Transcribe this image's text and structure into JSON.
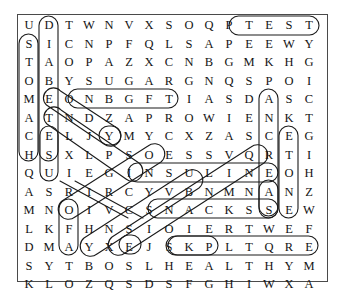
{
  "puzzle": {
    "title": "Diabetes Word Search",
    "rows": 15,
    "cols": 15,
    "grid": [
      [
        "U",
        "D",
        "T",
        "W",
        "N",
        "V",
        "X",
        "S",
        "O",
        "Q",
        "P",
        "T",
        "E",
        "S",
        "T"
      ],
      [
        "S",
        "I",
        "C",
        "N",
        "P",
        "F",
        "Q",
        "L",
        "S",
        "A",
        "P",
        "E",
        "E",
        "W",
        "Y"
      ],
      [
        "T",
        "A",
        "O",
        "P",
        "A",
        "Z",
        "X",
        "C",
        "N",
        "B",
        "G",
        "M",
        "K",
        "H",
        "G"
      ],
      [
        "O",
        "B",
        "Y",
        "S",
        "U",
        "G",
        "A",
        "R",
        "G",
        "N",
        "Q",
        "S",
        "P",
        "O",
        "I"
      ],
      [
        "M",
        "E",
        "O",
        "N",
        "B",
        "G",
        "F",
        "T",
        "I",
        "A",
        "S",
        "D",
        "A",
        "S",
        "C"
      ],
      [
        "A",
        "T",
        "N",
        "D",
        "Z",
        "A",
        "P",
        "R",
        "O",
        "W",
        "I",
        "E",
        "N",
        "K",
        "T"
      ],
      [
        "C",
        "E",
        "L",
        "J",
        "Y",
        "M",
        "Y",
        "C",
        "X",
        "Z",
        "A",
        "S",
        "C",
        "E",
        "G"
      ],
      [
        "H",
        "S",
        "X",
        "L",
        "P",
        "S",
        "O",
        "E",
        "S",
        "S",
        "V",
        "Q",
        "R",
        "T",
        "I"
      ],
      [
        "Q",
        "U",
        "I",
        "E",
        "G",
        "I",
        "N",
        "S",
        "U",
        "L",
        "I",
        "N",
        "E",
        "O",
        "H"
      ],
      [
        "A",
        "S",
        "R",
        "I",
        "R",
        "C",
        "Y",
        "V",
        "B",
        "N",
        "M",
        "N",
        "A",
        "N",
        "Z"
      ],
      [
        "M",
        "N",
        "O",
        "I",
        "V",
        "C",
        "S",
        "N",
        "A",
        "C",
        "K",
        "S",
        "S",
        "E",
        "W"
      ],
      [
        "L",
        "K",
        "F",
        "H",
        "N",
        "S",
        "I",
        "O",
        "I",
        "E",
        "R",
        "T",
        "W",
        "E",
        "F"
      ],
      [
        "D",
        "M",
        "A",
        "Y",
        "X",
        "E",
        "J",
        "S",
        "K",
        "P",
        "L",
        "T",
        "Q",
        "R",
        "E"
      ],
      [
        "S",
        "Y",
        "T",
        "B",
        "O",
        "S",
        "L",
        "H",
        "E",
        "A",
        "L",
        "T",
        "H",
        "Y",
        "M"
      ],
      [
        "K",
        "L",
        "O",
        "Z",
        "Q",
        "S",
        "D",
        "S",
        "F",
        "G",
        "H",
        "I",
        "W",
        "X",
        "A"
      ]
    ],
    "found_words": [
      {
        "word": "TEST",
        "orientation": "horizontal",
        "row": 0,
        "col": 11,
        "length": 4
      },
      {
        "word": "SUGAR",
        "orientation": "horizontal",
        "row": 3,
        "col": 3,
        "length": 5
      },
      {
        "word": "INSULIN",
        "orientation": "horizontal",
        "row": 8,
        "col": 5,
        "length": 7
      },
      {
        "word": "SNACKS",
        "orientation": "horizontal",
        "row": 10,
        "col": 6,
        "length": 6
      },
      {
        "word": "HEALTHY",
        "orientation": "horizontal",
        "row": 13,
        "col": 7,
        "length": 7
      },
      {
        "word": "STOMACH",
        "orientation": "vertical",
        "row": 1,
        "col": 0,
        "length": 7
      },
      {
        "word": "DIABETES",
        "orientation": "vertical",
        "row": 0,
        "col": 1,
        "length": 8
      },
      {
        "word": "ESU",
        "orientation": "vertical",
        "row": 6,
        "col": 1,
        "length": 3
      },
      {
        "word": "PANCREAS",
        "orientation": "vertical",
        "row": 3,
        "col": 12,
        "length": 8
      },
      {
        "word": "KETONES",
        "orientation": "vertical",
        "row": 5,
        "col": 13,
        "length": 7
      },
      {
        "word": "FAT",
        "orientation": "vertical",
        "row": 11,
        "col": 2,
        "length": 3
      },
      {
        "word": "BODY",
        "orientation": "diagonal-down-right",
        "row": 3,
        "col": 1,
        "length": 4
      },
      {
        "word": "ENDS",
        "orientation": "diagonal-down-right",
        "row": 4,
        "col": 1,
        "length": 4
      },
      {
        "word": "EXERCISE",
        "orientation": "diagonal-up-right",
        "row": 13,
        "col": 5,
        "length": 8
      },
      {
        "word": "URINE",
        "orientation": "diagonal-up-right",
        "row": 11,
        "col": 3,
        "length": 5
      },
      {
        "word": "SUGARS",
        "orientation": "diagonal-up-right",
        "row": 12,
        "col": 7,
        "length": 6
      },
      {
        "word": "HEALTH",
        "orientation": "diagonal-up-right",
        "row": 13,
        "col": 7,
        "length": 6
      }
    ],
    "colors": {
      "letter": "#141414",
      "frame": "#4a4a4a",
      "mark": "#1b1b1b",
      "background": "#ffffff"
    }
  }
}
